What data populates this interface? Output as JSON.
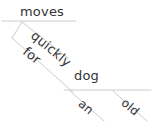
{
  "diagram": {
    "type": "reed-kellogg-sentence-diagram",
    "canvas": {
      "width": 155,
      "height": 123
    },
    "colors": {
      "line": "#cccccc",
      "text": "#333333",
      "background": "#ffffff"
    },
    "words": {
      "moves": "moves",
      "quickly": "quickly",
      "for": "for",
      "dog": "dog",
      "an": "an",
      "old": "old"
    },
    "lines": [
      {
        "name": "upper-baseline",
        "x1": 2,
        "y1": 21,
        "x2": 76,
        "y2": 21
      },
      {
        "name": "quickly-slant",
        "x1": 22,
        "y1": 22,
        "x2": 68,
        "y2": 58
      },
      {
        "name": "for-hook",
        "x1": 22,
        "y1": 22,
        "x2": 12,
        "y2": 38
      },
      {
        "name": "for-slant",
        "x1": 12,
        "y1": 38,
        "x2": 73,
        "y2": 92
      },
      {
        "name": "lower-baseline",
        "x1": 64,
        "y1": 90,
        "x2": 151,
        "y2": 90
      },
      {
        "name": "an-slant",
        "x1": 70,
        "y1": 91,
        "x2": 104,
        "y2": 121
      },
      {
        "name": "old-slant",
        "x1": 113,
        "y1": 91,
        "x2": 147,
        "y2": 121
      }
    ]
  }
}
